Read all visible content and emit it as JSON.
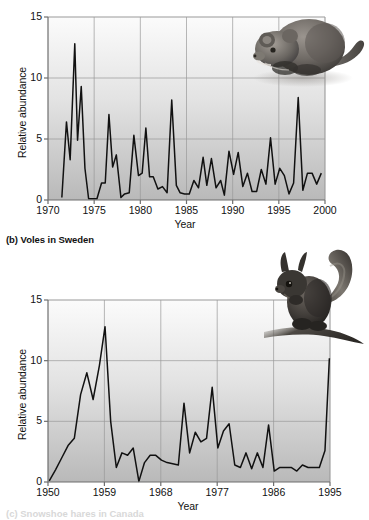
{
  "figure": {
    "panels": [
      {
        "id": "a",
        "caption": "",
        "animal": "vole-illustration",
        "chart_data": {
          "type": "line",
          "title": "",
          "xlabel": "Year",
          "ylabel": "Relative abundance",
          "xlim": [
            1970,
            2000
          ],
          "ylim": [
            0,
            15
          ],
          "xticks": [
            1970,
            1975,
            1980,
            1985,
            1990,
            1995,
            2000
          ],
          "yticks": [
            0,
            5,
            10,
            15
          ],
          "grid": true,
          "legend": "none",
          "x": [
            1971.5,
            1972,
            1972.4,
            1972.9,
            1973.2,
            1973.6,
            1974,
            1974.4,
            1974.9,
            1975.3,
            1975.8,
            1976.2,
            1976.6,
            1977,
            1977.4,
            1977.9,
            1978.3,
            1978.8,
            1979.3,
            1979.8,
            1980.2,
            1980.6,
            1981,
            1981.4,
            1981.9,
            1982.4,
            1982.9,
            1983.4,
            1983.9,
            1984.3,
            1984.8,
            1985.3,
            1985.8,
            1986.3,
            1986.8,
            1987.2,
            1987.7,
            1988.2,
            1988.7,
            1989.1,
            1989.6,
            1990.1,
            1990.6,
            1991.1,
            1991.6,
            1992.1,
            1992.6,
            1993.1,
            1993.6,
            1994.1,
            1994.6,
            1995.1,
            1995.6,
            1996.1,
            1996.6,
            1997.1,
            1997.6,
            1998.1,
            1998.6,
            1999.1,
            1999.6
          ],
          "values": [
            0.2,
            6.4,
            3.3,
            12.8,
            4.9,
            9.3,
            2.6,
            0.1,
            0.1,
            0.1,
            1.4,
            1.4,
            7.0,
            2.7,
            3.7,
            0.2,
            0.5,
            0.6,
            5.3,
            2.0,
            2.2,
            5.9,
            1.9,
            1.9,
            0.9,
            1.1,
            0.6,
            8.2,
            1.2,
            0.6,
            0.5,
            0.5,
            1.6,
            1.0,
            3.5,
            1.2,
            3.4,
            1.0,
            1.6,
            0.4,
            4.0,
            2.1,
            3.9,
            1.1,
            2.2,
            0.7,
            0.7,
            2.5,
            1.3,
            5.1,
            1.3,
            2.6,
            2.0,
            0.5,
            1.4,
            8.4,
            0.8,
            2.2,
            2.2,
            1.3,
            2.2
          ]
        }
      },
      {
        "id": "b",
        "caption": "(b) Voles in Sweden",
        "animal": "squirrel-illustration",
        "chart_data": {
          "type": "line",
          "title": "",
          "xlabel": "Year",
          "ylabel": "Relative abundance",
          "xlim": [
            1950,
            1995
          ],
          "ylim": [
            0,
            15
          ],
          "xticks": [
            1950,
            1959,
            1968,
            1977,
            1986,
            1995
          ],
          "yticks": [
            0,
            5,
            10,
            15
          ],
          "grid": true,
          "legend": "none",
          "x": [
            1950.2,
            1951.2,
            1952.2,
            1953.2,
            1954.2,
            1955.2,
            1956.2,
            1957.2,
            1958.2,
            1959.1,
            1960.0,
            1960.9,
            1961.8,
            1962.7,
            1963.6,
            1964.5,
            1965.4,
            1966.3,
            1967.2,
            1968.1,
            1969.0,
            1969.9,
            1970.8,
            1971.7,
            1972.6,
            1973.5,
            1974.4,
            1975.3,
            1976.2,
            1977.1,
            1978.0,
            1978.9,
            1979.8,
            1980.7,
            1981.6,
            1982.5,
            1983.4,
            1984.3,
            1985.2,
            1986.1,
            1987.0,
            1987.9,
            1988.8,
            1989.7,
            1990.6,
            1991.5,
            1992.4,
            1993.3,
            1994.2,
            1994.9
          ],
          "values": [
            0.1,
            1.0,
            2.0,
            3.0,
            3.6,
            7.2,
            9.0,
            6.8,
            9.6,
            12.8,
            5.0,
            1.2,
            2.4,
            2.2,
            2.8,
            0.05,
            1.6,
            2.2,
            2.2,
            1.8,
            1.6,
            1.5,
            1.4,
            6.5,
            2.4,
            4.1,
            3.3,
            3.6,
            7.8,
            2.8,
            4.2,
            4.8,
            1.4,
            1.2,
            2.4,
            1.1,
            2.4,
            1.2,
            4.7,
            0.9,
            1.2,
            1.2,
            1.2,
            0.9,
            1.4,
            1.2,
            1.2,
            1.2,
            2.6,
            10.2
          ]
        }
      }
    ],
    "footer_partial": "(c) Snowshoe hares in Canada"
  }
}
